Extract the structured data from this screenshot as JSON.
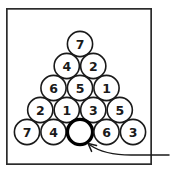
{
  "figure": {
    "background_color": "#ffffff",
    "frame": {
      "stroke_color": "#2b2b2b",
      "x": 6,
      "y": 8,
      "width": 146,
      "height": 157
    },
    "ball": {
      "radius": 12.6,
      "fill_color": "#ffffff",
      "stroke_color": "#1a1a1a",
      "empty_stroke_color": "#000000"
    },
    "layout": {
      "apex_x": 80,
      "apex_y": 44,
      "row_step_y": 22,
      "col_step_x": 26.5,
      "row_count": 5
    },
    "rows": [
      {
        "row_index": 0,
        "balls": [
          {
            "label": "7",
            "empty": false
          }
        ]
      },
      {
        "row_index": 1,
        "balls": [
          {
            "label": "4",
            "empty": false
          },
          {
            "label": "2",
            "empty": false
          }
        ]
      },
      {
        "row_index": 2,
        "balls": [
          {
            "label": "6",
            "empty": false
          },
          {
            "label": "5",
            "empty": false
          },
          {
            "label": "1",
            "empty": false
          }
        ]
      },
      {
        "row_index": 3,
        "balls": [
          {
            "label": "2",
            "empty": false
          },
          {
            "label": "1",
            "empty": false
          },
          {
            "label": "3",
            "empty": false
          },
          {
            "label": "5",
            "empty": false
          }
        ]
      },
      {
        "row_index": 4,
        "balls": [
          {
            "label": "7",
            "empty": false
          },
          {
            "label": "4",
            "empty": false
          },
          {
            "label": "",
            "empty": true
          },
          {
            "label": "6",
            "empty": false
          },
          {
            "label": "3",
            "empty": false
          }
        ]
      }
    ],
    "pointer": {
      "name": "curved-arrow-to-empty-ball",
      "stroke_color": "#1a1a1a",
      "path": "M 169 155 L 131 155 C 112 155 100 152 90 145",
      "head": "M 96.5 145.5 L 88.2 143.6 L 91.6 151.4"
    }
  }
}
